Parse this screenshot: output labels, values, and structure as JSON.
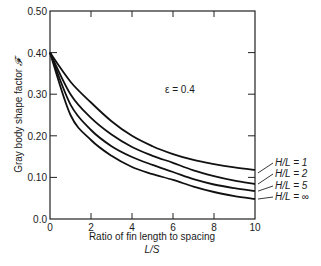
{
  "chart_data": {
    "type": "line",
    "title": "",
    "xlabel": "Ratio of fin length to spacing",
    "xlabel_symbol": "L/S",
    "ylabel": "Gray body shape factor 𝓕",
    "xlim": [
      0,
      10
    ],
    "ylim": [
      0.0,
      0.5
    ],
    "xticks": [
      0,
      2,
      4,
      6,
      8,
      10
    ],
    "xtick_labels": [
      "0",
      "2",
      "4",
      "6",
      "8",
      "10"
    ],
    "yticks": [
      0.0,
      0.1,
      0.2,
      0.3,
      0.4,
      0.5
    ],
    "ytick_labels": [
      "0.0",
      "0.10",
      "0.20",
      "0.30",
      "0.40",
      "0.50"
    ],
    "grid": false,
    "legend_position": "right, inline labels with leader lines",
    "annotation": "ε = 0.4",
    "x": [
      0,
      1,
      2,
      3,
      4,
      5,
      6,
      7,
      8,
      9,
      10
    ],
    "series": [
      {
        "name": "H/L = 1",
        "values": [
          0.4,
          0.33,
          0.28,
          0.235,
          0.2,
          0.175,
          0.156,
          0.142,
          0.132,
          0.124,
          0.118
        ]
      },
      {
        "name": "H/L = 2",
        "values": [
          0.4,
          0.3,
          0.243,
          0.203,
          0.173,
          0.152,
          0.135,
          0.117,
          0.103,
          0.092,
          0.084
        ]
      },
      {
        "name": "H/L = 5",
        "values": [
          0.4,
          0.275,
          0.214,
          0.175,
          0.149,
          0.13,
          0.113,
          0.096,
          0.083,
          0.074,
          0.067
        ]
      },
      {
        "name": "H/L = ∞",
        "values": [
          0.4,
          0.25,
          0.19,
          0.152,
          0.125,
          0.108,
          0.094,
          0.078,
          0.065,
          0.055,
          0.048
        ]
      }
    ]
  },
  "labels": {
    "ylabel_text": "Gray body shape factor ",
    "ylabel_symbol": "𝓕",
    "xlabel_line1": "Ratio of fin length to spacing",
    "xlabel_line2": "L/S",
    "annotation": "ε = 0.4"
  }
}
